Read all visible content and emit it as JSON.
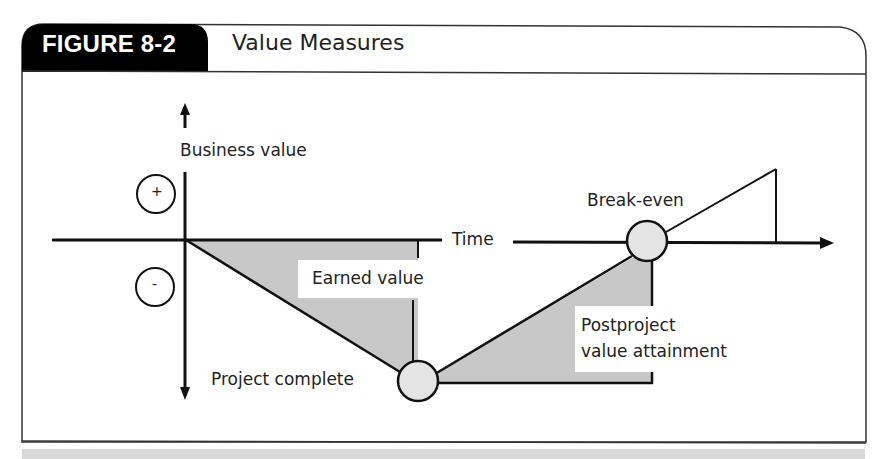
{
  "figure": {
    "number_label": "FIGURE 8-2",
    "title": "Value Measures"
  },
  "diagram": {
    "y_axis_label": "Business value",
    "x_axis_label": "Time",
    "positive_marker": "+",
    "negative_marker": "-",
    "labels": {
      "earned_value": "Earned value",
      "project_complete": "Project complete",
      "break_even": "Break-even",
      "postproject_line1": "Postproject",
      "postproject_line2": "value attainment"
    },
    "colors": {
      "shade": "#c8c8c8",
      "node_fill": "#e4e4e4",
      "stroke": "#111111",
      "tab_fill": "#000000"
    }
  }
}
